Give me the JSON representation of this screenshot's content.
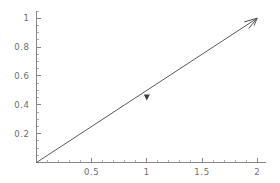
{
  "chart_data": {
    "type": "line",
    "title": "",
    "subtitle": "",
    "xlabel": "",
    "ylabel": "",
    "xlim": [
      0,
      2.08
    ],
    "ylim": [
      0,
      1.05
    ],
    "grid": false,
    "legend": null,
    "x_ticks": [
      {
        "value": 0.5,
        "label": "0.5"
      },
      {
        "value": 1,
        "label": "1"
      },
      {
        "value": 1.5,
        "label": "1.5"
      },
      {
        "value": 2,
        "label": "2"
      }
    ],
    "y_ticks": [
      {
        "value": 0.2,
        "label": "0.2"
      },
      {
        "value": 0.4,
        "label": "0.4"
      },
      {
        "value": 0.6,
        "label": "0.6"
      },
      {
        "value": 0.8,
        "label": "0.8"
      },
      {
        "value": 1,
        "label": "1"
      }
    ],
    "x_minor_tick_step": 0.1,
    "y_minor_tick_step": 0.05,
    "series": [
      {
        "name": "vector",
        "style": "arrow",
        "x": [
          0,
          2
        ],
        "y": [
          0,
          1
        ],
        "color": "#5a5a5a",
        "arrowhead": "open-barbed",
        "annotation_marker": {
          "shape": "triangle-down",
          "x": 1.0,
          "y": 0.45,
          "color": "#3c3c3c"
        }
      }
    ],
    "annotations": []
  },
  "axes": {
    "x_axis_name": "horizontal-axis",
    "y_axis_name": "vertical-axis",
    "axis_color": "#7a7a7a"
  },
  "figure": {
    "background": "#ffffff",
    "width": 280,
    "height": 183
  }
}
